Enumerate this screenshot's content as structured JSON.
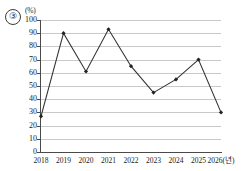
{
  "figure": {
    "item_number": "③",
    "y_unit_label": "(%)",
    "x_unit_suffix": "(년)"
  },
  "chart_data": {
    "type": "line",
    "title": "",
    "xlabel": "(년)",
    "ylabel": "(%)",
    "categories": [
      "2018",
      "2019",
      "2020",
      "2021",
      "2022",
      "2023",
      "2024",
      "2025",
      "2026"
    ],
    "x_tick_labels": [
      "2018",
      "2019",
      "2020",
      "2021",
      "2022",
      "2023",
      "2024",
      "2025",
      "2026(년)"
    ],
    "values": [
      27,
      90,
      61,
      93,
      65,
      45,
      55,
      70,
      30
    ],
    "y_tick_labels": [
      "0",
      "10",
      "20",
      "30",
      "40",
      "50",
      "60",
      "70",
      "80",
      "90",
      "100"
    ],
    "y_ticks": [
      0,
      10,
      20,
      30,
      40,
      50,
      60,
      70,
      80,
      90,
      100
    ],
    "ylim": [
      0,
      100
    ],
    "grid": true,
    "grid_axis": "y",
    "legend": false,
    "marker": "diamond",
    "line_color": "#333333",
    "marker_color": "#222222",
    "grid_color": "#c9c9c9",
    "axis_color": "#4a4a4a"
  }
}
